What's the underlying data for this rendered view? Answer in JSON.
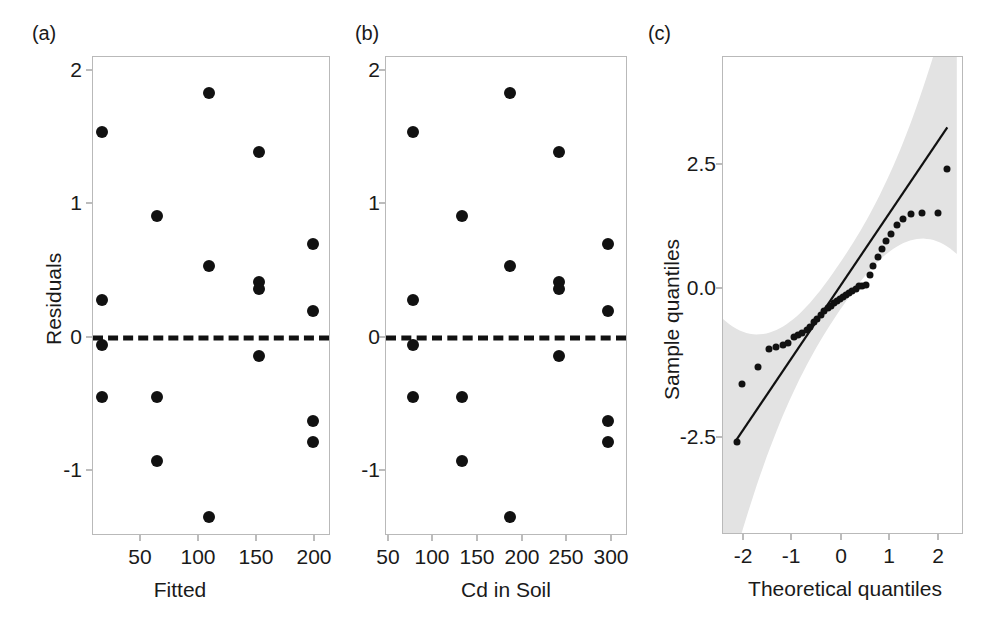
{
  "figure": {
    "background": "#ffffff",
    "point_color": "#111111",
    "axis_color": "#b9b9b9",
    "band_color": "#e3e3e3"
  },
  "panels": [
    {
      "letter": "(a)",
      "name": "residuals-vs-fitted"
    },
    {
      "letter": "(b)",
      "name": "residuals-vs-cd-in-soil"
    },
    {
      "letter": "(c)",
      "name": "normal-qq-plot"
    }
  ],
  "chart_data": [
    {
      "type": "scatter",
      "panel": "(a)",
      "title": "",
      "xlabel": "Fitted",
      "ylabel": "Residuals",
      "xlim": [
        12,
        218
      ],
      "ylim": [
        -1.42,
        2.2
      ],
      "xticks": [
        50,
        100,
        150,
        200
      ],
      "xtick_labels": [
        "50",
        "100",
        "150",
        "200"
      ],
      "yticks": [
        -1,
        0,
        1,
        2
      ],
      "ytick_labels": [
        "-1",
        "0",
        "1",
        "2"
      ],
      "grid": false,
      "legend": "none",
      "reference_line": {
        "type": "horizontal-dashed",
        "y": 0
      },
      "x": [
        20,
        20,
        20,
        20,
        67,
        67,
        67,
        112,
        112,
        112,
        156,
        156,
        156,
        156,
        202,
        202,
        202,
        202
      ],
      "y": [
        1.63,
        0.36,
        0.02,
        -0.37,
        1.0,
        -0.37,
        -0.85,
        1.93,
        0.62,
        -1.28,
        1.48,
        0.5,
        0.45,
        -0.06,
        0.79,
        0.28,
        -0.55,
        -0.71
      ]
    },
    {
      "type": "scatter",
      "panel": "(b)",
      "title": "",
      "xlabel": "Cd in Soil",
      "ylabel": "Residuals",
      "xlim": [
        27,
        325
      ],
      "ylim": [
        -1.42,
        2.2
      ],
      "xticks": [
        50,
        100,
        150,
        200,
        250,
        300
      ],
      "xtick_labels": [
        "50",
        "100",
        "150",
        "200",
        "250",
        "300"
      ],
      "yticks": [
        -1,
        0,
        1,
        2
      ],
      "ytick_labels": [
        "-1",
        "0",
        "1",
        "2"
      ],
      "grid": false,
      "legend": "none",
      "reference_line": {
        "type": "horizontal-dashed",
        "y": 0
      },
      "x": [
        60,
        60,
        60,
        60,
        120,
        120,
        120,
        180,
        180,
        180,
        240,
        240,
        240,
        240,
        300,
        300,
        300,
        300
      ],
      "y": [
        1.63,
        0.36,
        0.02,
        -0.37,
        1.0,
        -0.37,
        -0.85,
        1.93,
        0.62,
        -1.28,
        1.48,
        0.5,
        0.45,
        -0.06,
        0.79,
        0.28,
        -0.55,
        -0.71
      ]
    },
    {
      "type": "scatter",
      "panel": "(c)",
      "title": "",
      "xlabel": "Theoretical quantiles",
      "ylabel": "Sample quantiles",
      "xlim": [
        -2.45,
        2.6
      ],
      "ylim": [
        -4.4,
        4.1
      ],
      "xticks": [
        -2,
        -1,
        0,
        1,
        2
      ],
      "xtick_labels": [
        "-2",
        "-1",
        "0",
        "1",
        "2"
      ],
      "yticks": [
        -2.5,
        0.0,
        2.5
      ],
      "ytick_labels": [
        "-2.5",
        "0.0",
        "2.5"
      ],
      "grid": false,
      "legend": "none",
      "reference_line": {
        "type": "diagonal",
        "p1": [
          -2.2,
          -2.75
        ],
        "p2": [
          2.25,
          2.85
        ]
      },
      "confidence_band": "shaded grey pointwise envelope",
      "x": [
        -2.15,
        -2.05,
        -1.72,
        -1.48,
        -1.33,
        -1.2,
        -1.08,
        -0.97,
        -0.88,
        -0.79,
        -0.7,
        -0.62,
        -0.54,
        -0.47,
        -0.4,
        -0.33,
        -0.26,
        -0.19,
        -0.13,
        -0.06,
        0.0,
        0.06,
        0.13,
        0.19,
        0.26,
        0.33,
        0.4,
        0.47,
        0.54,
        0.62,
        0.7,
        0.79,
        0.88,
        0.97,
        1.08,
        1.2,
        1.33,
        1.48,
        1.72,
        2.05,
        2.25
      ],
      "y": [
        -2.75,
        -1.72,
        -1.42,
        -1.1,
        -1.05,
        -1.02,
        -0.98,
        -0.88,
        -0.84,
        -0.8,
        -0.75,
        -0.7,
        -0.62,
        -0.56,
        -0.48,
        -0.42,
        -0.36,
        -0.32,
        -0.28,
        -0.24,
        -0.2,
        -0.16,
        -0.13,
        -0.1,
        -0.06,
        -0.02,
        0.02,
        0.03,
        0.05,
        0.22,
        0.38,
        0.55,
        0.68,
        0.82,
        0.95,
        1.12,
        1.22,
        1.3,
        1.32,
        1.33,
        2.1
      ]
    }
  ]
}
